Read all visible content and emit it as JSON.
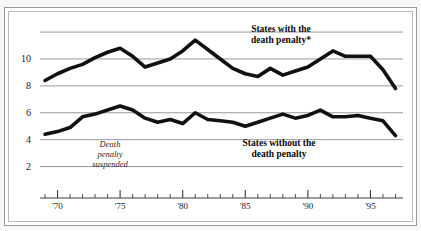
{
  "figure": {
    "clipped_caption": "",
    "frame_color": "#9a9a9a",
    "background": "#ffffff",
    "line_color": "#111111",
    "gridline_color": "#9a9a9a"
  },
  "labels": {
    "series_with": "States with the\ndeath penalty*",
    "series_with_line1": "States with the",
    "series_with_line2": "death penalty*",
    "series_without_line1": "States without the",
    "series_without_line2": "death penalty",
    "annotation_line1": "Death",
    "annotation_line2": "penalty",
    "annotation_line3": "suspended"
  },
  "chart_data": {
    "type": "line",
    "title": "",
    "subtitle": "",
    "xlabel": "",
    "ylabel": "",
    "xlim": [
      1968.6,
      1997.6
    ],
    "ylim": [
      1.0,
      12.6
    ],
    "yticks": [
      2,
      4,
      6,
      8,
      10
    ],
    "ytick_labels": [
      "2",
      "4",
      "6",
      "8",
      "10"
    ],
    "gridlines": [
      2,
      4,
      6,
      8,
      10,
      12
    ],
    "grid": true,
    "legend_position": "inline-annotations",
    "xticks_major": [
      1970,
      1975,
      1980,
      1985,
      1990,
      1995
    ],
    "xtick_labels": [
      "'70",
      "'75",
      "'80",
      "'85",
      "'90",
      "'95"
    ],
    "xticks_minor_start": 1969,
    "xticks_minor_end": 1997,
    "annotations": [
      {
        "text": "Death penalty suspended",
        "x": 1973.2,
        "y": 3.3,
        "style": "italic"
      },
      {
        "text": "States with the death penalty*",
        "x": 1984.5,
        "y": 12.0,
        "style": "bold"
      },
      {
        "text": "States without the death penalty",
        "x": 1985.0,
        "y": 4.0,
        "style": "bold"
      }
    ],
    "x": [
      1969,
      1970,
      1971,
      1972,
      1973,
      1974,
      1975,
      1976,
      1977,
      1978,
      1979,
      1980,
      1981,
      1982,
      1983,
      1984,
      1985,
      1986,
      1987,
      1988,
      1989,
      1990,
      1991,
      1992,
      1993,
      1994,
      1995,
      1996,
      1997
    ],
    "series": [
      {
        "name": "States with the death penalty*",
        "values": [
          8.4,
          8.9,
          9.3,
          9.6,
          10.1,
          10.5,
          10.8,
          10.2,
          9.4,
          9.7,
          10.0,
          10.6,
          11.4,
          10.7,
          10.0,
          9.3,
          8.9,
          8.7,
          9.3,
          8.8,
          9.1,
          9.4,
          10.0,
          10.6,
          10.2,
          10.2,
          10.2,
          9.2,
          7.8
        ]
      },
      {
        "name": "States without the death penalty",
        "values": [
          4.4,
          4.6,
          4.9,
          5.7,
          5.9,
          6.2,
          6.5,
          6.2,
          5.6,
          5.3,
          5.5,
          5.2,
          6.0,
          5.5,
          5.4,
          5.3,
          5.0,
          5.3,
          5.6,
          5.9,
          5.6,
          5.8,
          6.2,
          5.7,
          5.7,
          5.8,
          5.6,
          5.4,
          4.3
        ]
      }
    ]
  }
}
